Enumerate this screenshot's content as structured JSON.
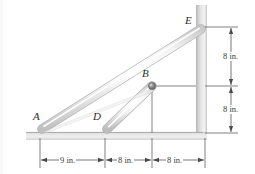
{
  "figure": {
    "kind": "statics-diagram",
    "background_color": "#ffffff"
  },
  "labels": {
    "point_a": "A",
    "point_b": "B",
    "point_d": "D",
    "point_e": "E"
  },
  "dimensions": {
    "horizontal": [
      {
        "text": "9 in.",
        "value": 9,
        "unit": "in."
      },
      {
        "text": "8 in.",
        "value": 8,
        "unit": "in."
      },
      {
        "text": "8 in.",
        "value": 8,
        "unit": "in."
      }
    ],
    "vertical": [
      {
        "text": "8 in.",
        "value": 8,
        "unit": "in."
      },
      {
        "text": "8 in.",
        "value": 8,
        "unit": "in."
      }
    ]
  },
  "colors": {
    "rod_fill": "#e9e9e9",
    "rod_edge": "#b3b3b3",
    "rod_highlight": "#fcfcfc",
    "pin_fill": "#8f8f8f",
    "pin_edge": "#5d5d5d",
    "ground_fill": "#d7d7d7",
    "wall_fill": "#d9d9d9",
    "dimension_line": "#4a4a4a",
    "reference_line": "#6e6e6e",
    "label_text": "#2b2b2b",
    "dimension_text": "#3a3a3a"
  },
  "geometry": {
    "ground_y": 133,
    "wall_x": 196,
    "pin_b": {
      "x": 152,
      "y": 86
    },
    "point_a": {
      "x": 40,
      "y": 130
    },
    "point_d": {
      "x": 105,
      "y": 130
    },
    "point_e": {
      "x": 203,
      "y": 27
    },
    "ticks_x": [
      40,
      105,
      152,
      205
    ],
    "ticks_y": [
      27,
      86,
      133
    ]
  }
}
